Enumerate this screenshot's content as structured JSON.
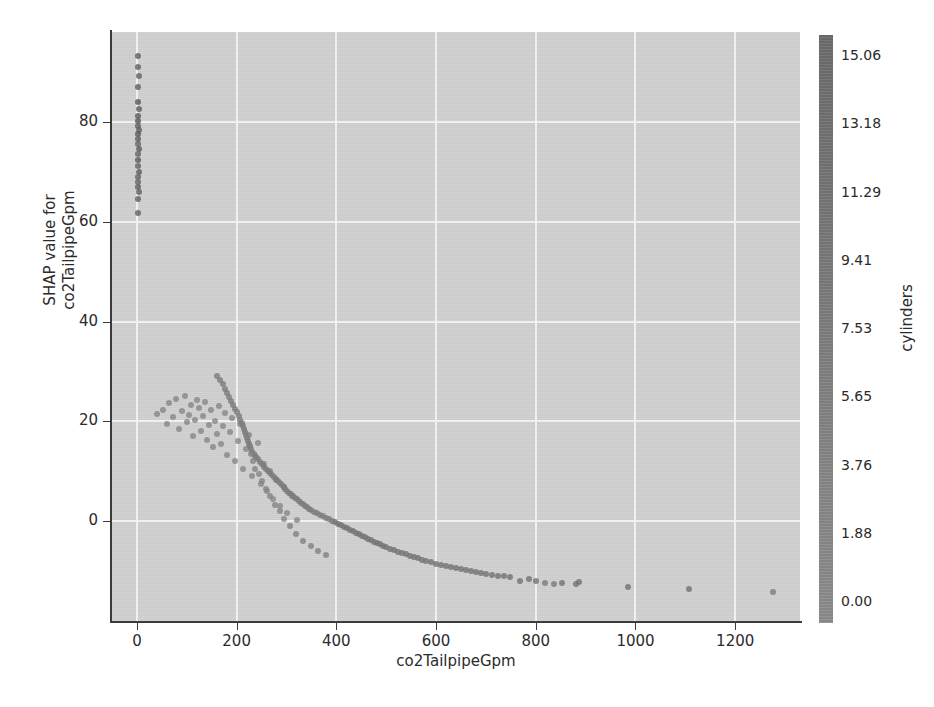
{
  "figure": {
    "background_color": "#ffffff",
    "plot_background_color": "#d0d0d0",
    "grid_color": "#f2f2f2"
  },
  "chart_data": {
    "type": "scatter",
    "title": "",
    "subtitle": "",
    "xlabel": "co2TailpipeGpm",
    "ylabel": "SHAP value for\nco2TailpipeGpm",
    "ylabel_lines": [
      "SHAP value for",
      "co2TailpipeGpm"
    ],
    "xlim": [
      -50,
      1330
    ],
    "ylim": [
      -20,
      98
    ],
    "xticks": [
      0,
      200,
      400,
      600,
      800,
      1000,
      1200
    ],
    "xticklabels": [
      "0",
      "200",
      "400",
      "600",
      "800",
      "1000",
      "1200"
    ],
    "yticks": [
      0,
      20,
      40,
      60,
      80
    ],
    "yticklabels": [
      "0",
      "20",
      "40",
      "60",
      "80"
    ],
    "grid": true,
    "grid_axes": "both",
    "legend": "colorbar-right",
    "colorbar": {
      "label": "cylinders",
      "ticks": [
        0.0,
        1.88,
        3.76,
        5.65,
        7.53,
        9.41,
        11.29,
        13.18,
        15.06
      ],
      "ticklabels": [
        "0.00",
        "1.88",
        "3.76",
        "5.65",
        "7.53",
        "9.41",
        "11.29",
        "13.18",
        "15.06"
      ],
      "vmin": 0.0,
      "vmax": 16.0,
      "colormap": "grayscale",
      "color_low": "#9a9a9a",
      "color_high": "#555555"
    },
    "point_size": 6,
    "point_opacity": 0.8,
    "series": [
      {
        "name": "vehicles",
        "color_field": "cylinders",
        "points": [
          [
            3,
            93.2,
            12.0
          ],
          [
            2,
            91.0,
            12.0
          ],
          [
            4,
            89.2,
            11.0
          ],
          [
            3,
            87.0,
            12.0
          ],
          [
            2,
            84.0,
            14.0
          ],
          [
            4,
            82.5,
            12.0
          ],
          [
            2,
            81.2,
            13.0
          ],
          [
            3,
            80.2,
            14.0
          ],
          [
            2,
            79.2,
            13.0
          ],
          [
            4,
            78.4,
            12.0
          ],
          [
            2,
            77.5,
            14.0
          ],
          [
            3,
            76.6,
            13.0
          ],
          [
            2,
            75.6,
            12.0
          ],
          [
            4,
            74.6,
            13.0
          ],
          [
            2,
            73.5,
            12.0
          ],
          [
            3,
            72.4,
            14.0
          ],
          [
            2,
            71.2,
            12.0
          ],
          [
            4,
            70.0,
            13.0
          ],
          [
            2,
            69.0,
            12.0
          ],
          [
            3,
            68.0,
            12.0
          ],
          [
            2,
            67.0,
            13.0
          ],
          [
            4,
            66.0,
            12.0
          ],
          [
            2,
            64.6,
            12.0
          ],
          [
            3,
            61.8,
            12.0
          ],
          [
            40,
            21.5,
            4.0
          ],
          [
            52,
            22.3,
            4.0
          ],
          [
            60,
            19.4,
            4.0
          ],
          [
            64,
            23.6,
            4.0
          ],
          [
            72,
            20.8,
            4.0
          ],
          [
            78,
            24.5,
            4.0
          ],
          [
            84,
            18.5,
            4.0
          ],
          [
            90,
            22.0,
            4.0
          ],
          [
            96,
            25.0,
            4.0
          ],
          [
            100,
            19.8,
            4.0
          ],
          [
            104,
            21.2,
            4.0
          ],
          [
            108,
            23.2,
            4.0
          ],
          [
            112,
            17.0,
            4.0
          ],
          [
            116,
            20.3,
            4.0
          ],
          [
            120,
            24.2,
            4.0
          ],
          [
            124,
            22.6,
            4.0
          ],
          [
            128,
            18.0,
            4.0
          ],
          [
            132,
            21.0,
            4.0
          ],
          [
            136,
            23.8,
            4.0
          ],
          [
            140,
            16.2,
            4.0
          ],
          [
            144,
            19.2,
            4.0
          ],
          [
            148,
            22.2,
            4.0
          ],
          [
            152,
            14.8,
            4.0
          ],
          [
            156,
            20.0,
            4.0
          ],
          [
            160,
            17.5,
            4.0
          ],
          [
            164,
            23.0,
            4.0
          ],
          [
            168,
            15.5,
            4.0
          ],
          [
            172,
            19.0,
            4.0
          ],
          [
            176,
            21.6,
            4.0
          ],
          [
            180,
            13.2,
            4.0
          ],
          [
            186,
            17.8,
            4.0
          ],
          [
            190,
            20.6,
            4.0
          ],
          [
            196,
            12.0,
            4.0
          ],
          [
            202,
            16.0,
            4.0
          ],
          [
            206,
            19.4,
            4.0
          ],
          [
            212,
            10.5,
            4.0
          ],
          [
            218,
            14.5,
            4.0
          ],
          [
            224,
            17.2,
            4.0
          ],
          [
            230,
            9.0,
            4.0
          ],
          [
            236,
            13.0,
            4.0
          ],
          [
            242,
            15.6,
            4.0
          ],
          [
            248,
            7.5,
            4.0
          ],
          [
            254,
            11.5,
            4.0
          ],
          [
            260,
            6.0,
            4.0
          ],
          [
            266,
            10.0,
            4.0
          ],
          [
            272,
            4.5,
            4.0
          ],
          [
            278,
            8.2,
            4.0
          ],
          [
            286,
            3.0,
            4.0
          ],
          [
            294,
            6.8,
            4.0
          ],
          [
            302,
            1.6,
            4.0
          ],
          [
            312,
            5.0,
            4.0
          ],
          [
            322,
            0.2,
            4.0
          ],
          [
            160,
            29.0,
            6.0
          ],
          [
            166,
            28.2,
            6.0
          ],
          [
            172,
            27.4,
            6.0
          ],
          [
            176,
            26.4,
            6.0
          ],
          [
            180,
            25.6,
            6.0
          ],
          [
            184,
            24.8,
            6.0
          ],
          [
            188,
            24.0,
            6.0
          ],
          [
            192,
            23.2,
            6.0
          ],
          [
            196,
            22.5,
            6.0
          ],
          [
            200,
            21.8,
            6.0
          ],
          [
            204,
            21.0,
            6.0
          ],
          [
            206,
            20.3,
            6.0
          ],
          [
            210,
            19.6,
            6.0
          ],
          [
            212,
            19.0,
            6.0
          ],
          [
            214,
            18.4,
            6.0
          ],
          [
            216,
            17.8,
            6.0
          ],
          [
            218,
            17.2,
            6.0
          ],
          [
            220,
            16.6,
            6.0
          ],
          [
            222,
            16.0,
            6.0
          ],
          [
            224,
            15.5,
            6.0
          ],
          [
            226,
            15.0,
            6.0
          ],
          [
            228,
            14.4,
            6.0
          ],
          [
            230,
            13.9,
            6.0
          ],
          [
            234,
            13.4,
            6.0
          ],
          [
            238,
            12.9,
            6.0
          ],
          [
            242,
            12.4,
            6.0
          ],
          [
            246,
            11.9,
            6.0
          ],
          [
            250,
            11.4,
            6.0
          ],
          [
            254,
            10.9,
            6.0
          ],
          [
            258,
            10.4,
            6.0
          ],
          [
            262,
            10.0,
            6.0
          ],
          [
            266,
            9.6,
            6.0
          ],
          [
            270,
            9.2,
            6.0
          ],
          [
            274,
            8.8,
            6.0
          ],
          [
            278,
            8.4,
            6.0
          ],
          [
            282,
            8.0,
            6.0
          ],
          [
            286,
            7.6,
            6.0
          ],
          [
            290,
            7.2,
            6.0
          ],
          [
            294,
            6.8,
            6.0
          ],
          [
            298,
            6.4,
            6.0
          ],
          [
            302,
            6.0,
            6.0
          ],
          [
            306,
            5.7,
            6.0
          ],
          [
            310,
            5.4,
            6.0
          ],
          [
            314,
            5.0,
            6.0
          ],
          [
            318,
            4.7,
            6.0
          ],
          [
            322,
            4.4,
            6.0
          ],
          [
            326,
            4.0,
            6.0
          ],
          [
            330,
            3.7,
            6.0
          ],
          [
            334,
            3.4,
            6.0
          ],
          [
            338,
            3.1,
            6.0
          ],
          [
            342,
            2.8,
            6.0
          ],
          [
            346,
            2.5,
            6.0
          ],
          [
            350,
            2.2,
            6.0
          ],
          [
            356,
            1.9,
            6.0
          ],
          [
            362,
            1.6,
            6.0
          ],
          [
            368,
            1.3,
            6.0
          ],
          [
            374,
            1.0,
            6.0
          ],
          [
            380,
            0.7,
            6.0
          ],
          [
            386,
            0.4,
            6.0
          ],
          [
            392,
            0.1,
            6.0
          ],
          [
            398,
            -0.2,
            8.0
          ],
          [
            404,
            -0.5,
            8.0
          ],
          [
            410,
            -0.8,
            8.0
          ],
          [
            416,
            -1.1,
            8.0
          ],
          [
            422,
            -1.4,
            8.0
          ],
          [
            428,
            -1.7,
            8.0
          ],
          [
            434,
            -2.0,
            8.0
          ],
          [
            440,
            -2.3,
            8.0
          ],
          [
            446,
            -2.6,
            8.0
          ],
          [
            452,
            -2.9,
            8.0
          ],
          [
            458,
            -3.2,
            8.0
          ],
          [
            464,
            -3.5,
            8.0
          ],
          [
            470,
            -3.8,
            8.0
          ],
          [
            476,
            -4.1,
            8.0
          ],
          [
            482,
            -4.4,
            8.0
          ],
          [
            488,
            -4.6,
            8.0
          ],
          [
            494,
            -4.9,
            8.0
          ],
          [
            500,
            -5.2,
            8.0
          ],
          [
            508,
            -5.5,
            8.0
          ],
          [
            516,
            -5.8,
            8.0
          ],
          [
            524,
            -6.1,
            8.0
          ],
          [
            532,
            -6.4,
            8.0
          ],
          [
            540,
            -6.6,
            8.0
          ],
          [
            548,
            -6.9,
            8.0
          ],
          [
            556,
            -7.2,
            8.0
          ],
          [
            564,
            -7.4,
            8.0
          ],
          [
            572,
            -7.7,
            8.0
          ],
          [
            580,
            -7.9,
            8.0
          ],
          [
            590,
            -8.2,
            8.0
          ],
          [
            600,
            -8.5,
            8.0
          ],
          [
            610,
            -8.7,
            8.0
          ],
          [
            620,
            -8.9,
            8.0
          ],
          [
            630,
            -9.1,
            8.0
          ],
          [
            640,
            -9.3,
            8.0
          ],
          [
            650,
            -9.5,
            8.0
          ],
          [
            660,
            -9.7,
            8.0
          ],
          [
            670,
            -9.9,
            8.0
          ],
          [
            680,
            -10.1,
            8.0
          ],
          [
            690,
            -10.3,
            8.0
          ],
          [
            700,
            -10.5,
            8.0
          ],
          [
            712,
            -10.7,
            8.0
          ],
          [
            724,
            -10.9,
            8.0
          ],
          [
            736,
            -11.0,
            8.0
          ],
          [
            748,
            -11.2,
            8.0
          ],
          [
            250,
            8.0,
            4.5
          ],
          [
            258,
            6.5,
            4.5
          ],
          [
            266,
            5.0,
            4.5
          ],
          [
            276,
            3.2,
            4.5
          ],
          [
            286,
            2.0,
            4.5
          ],
          [
            296,
            0.5,
            4.5
          ],
          [
            236,
            10.5,
            4.5
          ],
          [
            244,
            9.5,
            4.5
          ],
          [
            232,
            12.0,
            4.5
          ],
          [
            228,
            13.5,
            4.5
          ],
          [
            308,
            -1.0,
            5.0
          ],
          [
            320,
            -2.5,
            5.0
          ],
          [
            334,
            -4.0,
            5.0
          ],
          [
            350,
            -5.0,
            5.0
          ],
          [
            364,
            -6.0,
            5.0
          ],
          [
            380,
            -6.8,
            5.0
          ],
          [
            768,
            -12.0,
            8.0
          ],
          [
            786,
            -11.5,
            8.0
          ],
          [
            800,
            -12.0,
            8.0
          ],
          [
            818,
            -12.3,
            6.0
          ],
          [
            836,
            -12.5,
            6.0
          ],
          [
            852,
            -12.3,
            8.0
          ],
          [
            880,
            -12.6,
            8.0
          ],
          [
            886,
            -12.2,
            8.0
          ],
          [
            984,
            -13.2,
            8.0
          ],
          [
            1108,
            -13.6,
            8.0
          ],
          [
            1276,
            -14.2,
            6.5
          ]
        ]
      }
    ]
  }
}
